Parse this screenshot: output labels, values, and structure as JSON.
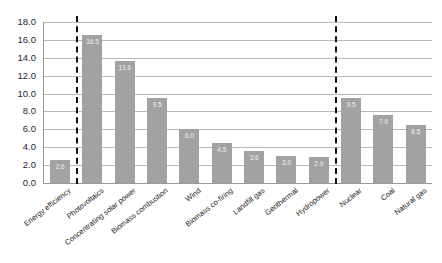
{
  "chart_data": {
    "type": "bar",
    "title": "",
    "subtitle": "",
    "xlabel": "",
    "ylabel": "",
    "ylim": [
      0.0,
      18.0
    ],
    "ytick_step": 2.0,
    "grid": true,
    "legend": "none",
    "bar_color": "#a2a2a2",
    "value_label_color": "#f2f2f2",
    "categories": [
      "Energy efficiency",
      "Photovoltaics",
      "Concentrating solar power",
      "Biomass combustion",
      "Wind",
      "Biomass co-firing",
      "Landfill gas",
      "Geothermal",
      "Hydropower",
      "Nuclear",
      "Coal",
      "Natural gas"
    ],
    "values": [
      2.6,
      16.5,
      13.6,
      9.5,
      6.0,
      4.5,
      3.6,
      3.0,
      2.9,
      9.5,
      7.6,
      6.5
    ],
    "value_labels": [
      "2.6",
      "16.5",
      "13.6",
      "9.5",
      "6.0",
      "4.5",
      "3.6",
      "3.0",
      "2.9",
      "9.5",
      "7.6",
      "6.5"
    ],
    "ytick_labels": [
      "0.0",
      "2.0",
      "4.0",
      "6.0",
      "8.0",
      "10.0",
      "12.0",
      "14.0",
      "16.0",
      "18.0"
    ],
    "ytick_values": [
      0.0,
      2.0,
      4.0,
      6.0,
      8.0,
      10.0,
      12.0,
      14.0,
      16.0,
      18.0
    ],
    "dividers": [
      {
        "after_category_index": 0,
        "style": "dashed",
        "color": "#111111"
      },
      {
        "after_category_index": 8,
        "style": "dashed",
        "color": "#111111"
      }
    ]
  }
}
